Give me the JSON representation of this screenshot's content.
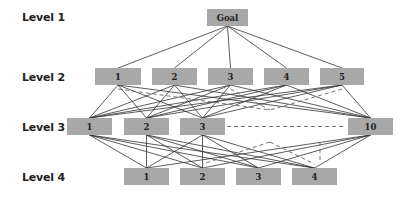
{
  "levels": [
    {
      "label": "Level 1",
      "x": 22,
      "y": 11
    },
    {
      "label": "Level 2",
      "x": 22,
      "y": 71
    },
    {
      "label": "Level 3",
      "x": 22,
      "y": 121
    },
    {
      "label": "Level 4",
      "x": 22,
      "y": 171
    }
  ],
  "colors": {
    "box": "#a8a8a8",
    "line": "#333333",
    "dash": "#666666"
  },
  "nodes": {
    "goal": {
      "label": "Goal",
      "x": 207,
      "y": 9,
      "w": 41,
      "h": 17
    },
    "level2": [
      {
        "label": "1",
        "x": 95,
        "y": 68,
        "w": 46,
        "h": 17
      },
      {
        "label": "2",
        "x": 152,
        "y": 68,
        "w": 45,
        "h": 17
      },
      {
        "label": "3",
        "x": 208,
        "y": 68,
        "w": 45,
        "h": 17
      },
      {
        "label": "4",
        "x": 264,
        "y": 68,
        "w": 45,
        "h": 17
      },
      {
        "label": "5",
        "x": 320,
        "y": 68,
        "w": 44,
        "h": 17
      }
    ],
    "level3": [
      {
        "label": "1",
        "x": 67,
        "y": 118,
        "w": 45,
        "h": 17
      },
      {
        "label": "2",
        "x": 124,
        "y": 118,
        "w": 45,
        "h": 17
      },
      {
        "label": "3",
        "x": 180,
        "y": 118,
        "w": 45,
        "h": 17
      },
      {
        "label": "10",
        "x": 348,
        "y": 118,
        "w": 45,
        "h": 17
      }
    ],
    "level4": [
      {
        "label": "1",
        "x": 124,
        "y": 168,
        "w": 45,
        "h": 17
      },
      {
        "label": "2",
        "x": 180,
        "y": 168,
        "w": 45,
        "h": 17
      },
      {
        "label": "3",
        "x": 236,
        "y": 168,
        "w": 45,
        "h": 17
      },
      {
        "label": "4",
        "x": 292,
        "y": 168,
        "w": 45,
        "h": 17
      }
    ]
  },
  "ellipsis_connector": {
    "style": "dashed",
    "from": "level3.3",
    "to": "level3.10"
  }
}
